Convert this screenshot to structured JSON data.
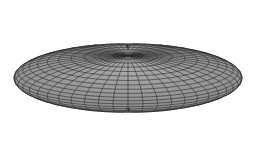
{
  "figure": {
    "type": "3d-wireframe-ellipsoid",
    "shape": "oblate spheroid",
    "colors": {
      "background": "#ffffff",
      "surface": "#a8a8a8",
      "surface_shade": "#8c8c8c",
      "mesh": "#2a2a2a"
    },
    "geometry": {
      "center_x": 128,
      "center_y": 78,
      "radius_x": 114,
      "radius_y": 68,
      "radius_z": 46,
      "tilt_deg": 38,
      "meridians": 48,
      "parallels": 24
    }
  }
}
